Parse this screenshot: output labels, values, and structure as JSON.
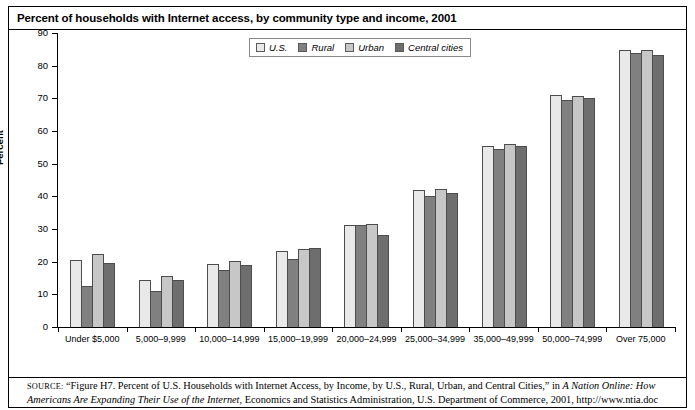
{
  "figure": {
    "title": "Percent of households with Internet access, by community type and income, 2001"
  },
  "source": {
    "label": "SOURCE:",
    "part1": " “Figure H7. Percent of U.S. Households with Internet Access, by Income, by U.S., Rural, Urban, and Central Cities,” in ",
    "italic1": "A Nation Online: How Americans Are Expanding Their Use of the Internet",
    "part2": ", Economics and Statistics Administration, U.S. Department of Commerce, 2001, http://www.ntia.doc"
  },
  "chart_data": {
    "type": "bar",
    "title": "Percent of households with Internet access, by community type and income, 2001",
    "xlabel": "",
    "ylabel": "Percent",
    "ylim": [
      0,
      90
    ],
    "ytick_step": 10,
    "yticks": [
      0,
      10,
      20,
      30,
      40,
      50,
      60,
      70,
      80,
      90
    ],
    "grid": false,
    "legend_position": "top-center",
    "categories": [
      "Under $5,000",
      "5,000–9,999",
      "10,000–14,999",
      "15,000–19,999",
      "20,000–24,999",
      "25,000–34,999",
      "35,000–49,999",
      "50,000–74,999",
      "Over 75,000"
    ],
    "series": [
      {
        "name": "U.S.",
        "color": "#e9e9e9",
        "values": [
          20.5,
          14.3,
          19.4,
          23.2,
          31.3,
          42.0,
          55.5,
          71.0,
          84.7
        ]
      },
      {
        "name": "Rural",
        "color": "#808080",
        "values": [
          12.5,
          11.0,
          17.6,
          20.9,
          31.2,
          40.2,
          54.4,
          69.6,
          83.8
        ]
      },
      {
        "name": "Urban",
        "color": "#c7c7c7",
        "values": [
          22.3,
          15.5,
          20.1,
          24.0,
          31.4,
          42.4,
          56.1,
          70.8,
          84.8
        ]
      },
      {
        "name": "Central cities",
        "color": "#6e6e6e",
        "values": [
          19.5,
          14.4,
          19.0,
          24.2,
          28.2,
          41.1,
          55.5,
          70.1,
          83.2
        ]
      }
    ]
  }
}
